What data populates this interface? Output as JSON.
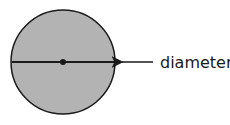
{
  "diagram": {
    "title": "",
    "shape": "circle",
    "fill_color": "#b3b3b3",
    "stroke_color": "#1a1a1a",
    "center": {
      "x": 63,
      "y": 62
    },
    "radius": 52,
    "label": "diameter",
    "annotation": "arrow pointing to diameter line"
  }
}
